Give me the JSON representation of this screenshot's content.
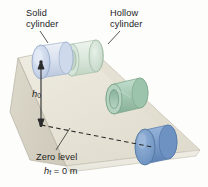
{
  "figure": {
    "labels": {
      "solid_cylinder": "Solid\ncylinder",
      "hollow_cylinder": "Hollow\ncylinder",
      "zero_level": "Zero level",
      "initial_height_symbol": "h",
      "initial_height_subscript": "0",
      "final_height_symbol": "h",
      "final_height_subscript": "f",
      "final_height_equation": " = 0 m"
    },
    "colors": {
      "incline_top_face": "#eae7dc",
      "incline_side_face": "#d8d4c6",
      "incline_front_face": "#f1efe8",
      "incline_outline": "#b9b5a6",
      "solid_cylinder_top": "#c9d4e8",
      "solid_cylinder_body": "#dde4f0",
      "solid_cylinder_edge": "#9fb0cc",
      "hollow_cylinder_top": "#cfe0d4",
      "hollow_cylinder_body": "#dfeade",
      "hollow_cylinder_edge": "#a9c2ad",
      "mid_cylinder_body": "#a8c9b4",
      "mid_cylinder_edge": "#7ea98d",
      "bottom_cylinder_body": "#7d9fcb",
      "bottom_cylinder_edge": "#5c80b0",
      "text": "#1c1c1c",
      "leader_line": "#3a3a3a",
      "arrow": "#2b2b2b",
      "dashed_line": "#2b2b2b"
    },
    "annotations": {
      "height_arrow": "double-headed vertical arrow marking initial height h0",
      "zero_dashed_line": "dashed horizontal line marking the zero level at the base"
    }
  }
}
